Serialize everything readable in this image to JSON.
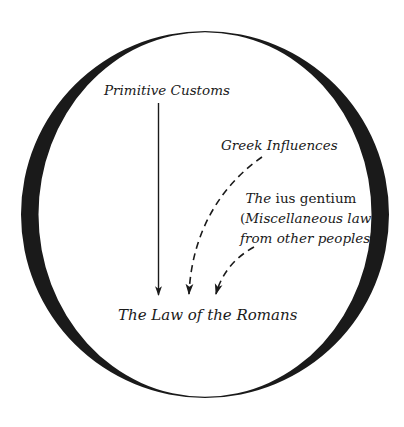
{
  "diagram": {
    "title": "",
    "nodes": {
      "primitive_customs": {
        "label": "Primitive Customs"
      },
      "greek_influences": {
        "label": "Greek Influences"
      },
      "ius_gentium": {
        "line1_prefix": "The",
        "line1_term": " ius gentium",
        "line2_open": "(",
        "line2_text": "Miscellaneous law",
        "line3_text": "from other peoples",
        "line3_close": ")"
      },
      "law_of_romans": {
        "label": "The Law of the Romans"
      }
    },
    "edges": [
      {
        "from": "primitive_customs",
        "to": "law_of_romans",
        "style": "solid"
      },
      {
        "from": "greek_influences",
        "to": "law_of_romans",
        "style": "dashed"
      },
      {
        "from": "ius_gentium",
        "to": "law_of_romans",
        "style": "dashed"
      }
    ],
    "colors": {
      "background": "#ffffff",
      "ink": "#1a1a1a"
    }
  }
}
